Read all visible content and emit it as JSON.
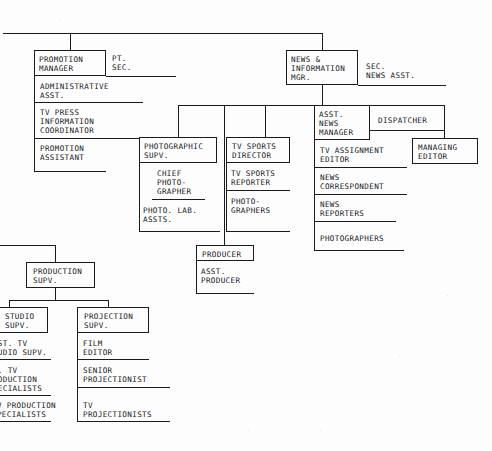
{
  "document": {
    "kind": "organization-chart",
    "medium": "scanned-typewritten-document",
    "ink_color": "#1a1a1f",
    "paper_color": "#fdfdfd"
  },
  "top_bus": {
    "note": "horizontal trunk line entering from left edge feeding the two top managers"
  },
  "promotion": {
    "manager": "PROMOTION\nMANAGER",
    "secretary": "PT.\nSEC.",
    "reports": [
      "ADMINISTRATIVE\nASST.",
      "TV PRESS\nINFORMATION\nCOORDINATOR",
      "PROMOTION\nASSISTANT"
    ]
  },
  "news": {
    "manager": "NEWS &\nINFORMATION\nMGR.",
    "secretary": "SEC.\nNEWS ASST.",
    "asst_manager": "ASST.\nNEWS\nMANAGER",
    "dispatcher": "DISPATCHER",
    "managing_editor": "MANAGING\nEDITOR",
    "reports": [
      "TV ASSIGNMENT\nEDITOR",
      "NEWS\nCORRESPONDENT",
      "NEWS\nREPORTERS",
      "PHOTOGRAPHERS"
    ]
  },
  "photographic": {
    "supervisor": "PHOTOGRAPHIC\nSUPV.",
    "chief": "CHIEF\nPHOTO-\nGRAPHER",
    "lab": "PHOTO. LAB.\nASSTS."
  },
  "sports": {
    "director": "TV SPORTS\nDIRECTOR",
    "reports": [
      "TV SPORTS\nREPORTER",
      "PHOTO-\nGRAPHERS"
    ]
  },
  "producer": {
    "head": "PRODUCER",
    "assistant": "ASST.\nPRODUCER"
  },
  "production": {
    "supervisor": "PRODUCTION\nSUPV."
  },
  "studio": {
    "supervisor": "STUDIO\nSUPV.",
    "reports": [
      "ASST. TV\nSTUDIO SUPV.",
      "SR. TV\nPRODUCTION\nSPECIALISTS",
      "TV PRODUCTION\nSPECIALISTS"
    ]
  },
  "projection": {
    "supervisor": "PROJECTION\nSUPV.",
    "reports": [
      "FILM\nEDITOR",
      "SENIOR\nPROJECTIONIST",
      "TV\nPROJECTIONISTS"
    ]
  }
}
